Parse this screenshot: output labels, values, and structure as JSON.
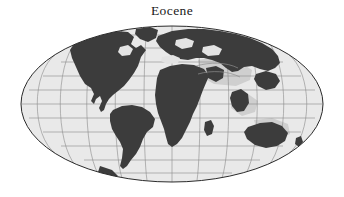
{
  "figure": {
    "title": "Eocene",
    "type": "paleogeographic-map",
    "projection": "Mollweide",
    "background_color": "#ffffff"
  },
  "map": {
    "ocean_color": "#e9e9e9",
    "land_color": "#3c3c3c",
    "graticule_color": "#8a8a8a",
    "outline_color": "#2b2b2b",
    "shelf_color": "#cfcfcf",
    "center_longitude_deg": 20,
    "graticule": {
      "meridian_interval_deg": 30,
      "parallel_interval_deg": 15,
      "meridian_count": 11,
      "parallel_count": 11,
      "parallel_latitudes_deg": [
        75,
        60,
        45,
        30,
        15,
        0,
        -15,
        -30,
        -45,
        -60,
        -75
      ],
      "meridian_longitudes_deg": [
        -160,
        -130,
        -100,
        -70,
        -40,
        -10,
        20,
        50,
        80,
        110,
        140,
        170
      ]
    },
    "ellipse": {
      "center_x": 172,
      "center_y": 104,
      "radius_x": 151,
      "radius_y": 78
    },
    "landmasses": [
      {
        "name": "north-america",
        "label": "North America"
      },
      {
        "name": "south-america",
        "label": "South America"
      },
      {
        "name": "africa",
        "label": "Africa"
      },
      {
        "name": "eurasia",
        "label": "Eurasia"
      },
      {
        "name": "greenland",
        "label": "Greenland"
      },
      {
        "name": "india",
        "label": "India"
      },
      {
        "name": "australia",
        "label": "Australia"
      },
      {
        "name": "antarctica",
        "label": "Antarctica"
      },
      {
        "name": "madagascar",
        "label": "Madagascar"
      },
      {
        "name": "arabia",
        "label": "Arabia"
      },
      {
        "name": "southeast-asia",
        "label": "Southeast Asia"
      },
      {
        "name": "new-zealand",
        "label": "New Zealand"
      }
    ]
  }
}
